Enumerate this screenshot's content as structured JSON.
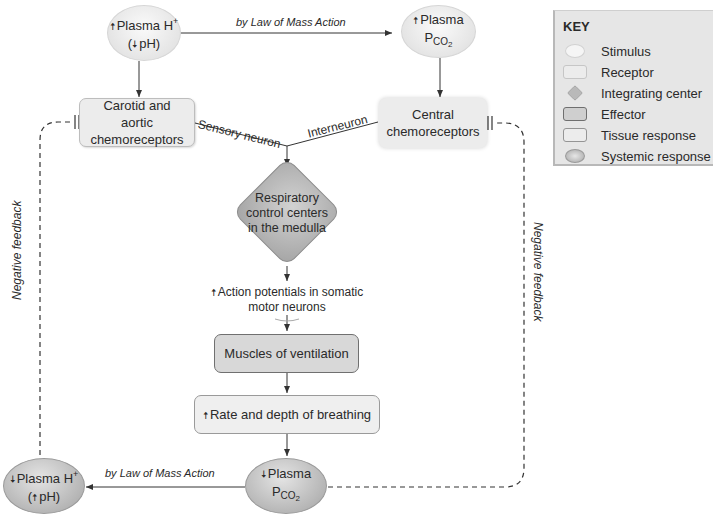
{
  "diagram": {
    "nodes": {
      "plasma_h_up": {
        "line1": "Plasma H",
        "sup": "+",
        "line2_pre": "(",
        "line2_arrow": "down",
        "line2": "pH)",
        "arrow": "up",
        "type": "Stimulus"
      },
      "plasma_pco2_up": {
        "line1": "Plasma",
        "line2": "P",
        "sub": "CO",
        "sub2": "2",
        "arrow": "up",
        "type": "Stimulus"
      },
      "carotid_aortic": {
        "text": "Carotid and aortic chemoreceptors",
        "type": "Receptor"
      },
      "central": {
        "text": "Central chemoreceptors",
        "type": "Receptor"
      },
      "respiratory_centers": {
        "text": "Respiratory control centers in the medulla",
        "type": "Integrating center"
      },
      "action_potentials": {
        "text": "Action potentials in somatic motor neurons",
        "arrow": "up"
      },
      "muscles": {
        "text": "Muscles of ventilation",
        "type": "Effector"
      },
      "rate_depth": {
        "text": "Rate and depth of breathing",
        "arrow": "up",
        "type": "Tissue response"
      },
      "plasma_pco2_down": {
        "line1": "Plasma",
        "line2": "P",
        "sub": "CO",
        "sub2": "2",
        "arrow": "down",
        "type": "Systemic response"
      },
      "plasma_h_down": {
        "line1": "Plasma H",
        "sup": "+",
        "line2_pre": "(",
        "line2_arrow": "up",
        "line2": "pH)",
        "arrow": "down",
        "type": "Systemic response"
      }
    },
    "edge_labels": {
      "mass_action_top": "by Law of Mass Action",
      "mass_action_bottom": "by Law of Mass Action",
      "sensory_neuron": "Sensory neuron",
      "interneuron": "Interneuron",
      "negative_feedback_left": "Negative feedback",
      "negative_feedback_right": "Negative feedback"
    },
    "glyphs": {
      "up": "🠅",
      "down": "🠇"
    }
  },
  "key": {
    "title": "KEY",
    "items": [
      {
        "label": "Stimulus",
        "shape": "ellipse-light"
      },
      {
        "label": "Receptor",
        "shape": "rounded-rect-light"
      },
      {
        "label": "Integrating center",
        "shape": "diamond"
      },
      {
        "label": "Effector",
        "shape": "rounded-rect-dark"
      },
      {
        "label": "Tissue response",
        "shape": "rounded-rect-outline"
      },
      {
        "label": "Systemic response",
        "shape": "ellipse-dark"
      }
    ]
  },
  "colors": {
    "line": "#333333",
    "stimulus_fill": "#ececec",
    "effector_fill": "#d8d8d8",
    "integrating_fill": "#bdbdbd",
    "key_bg": "#e6e6e6"
  }
}
